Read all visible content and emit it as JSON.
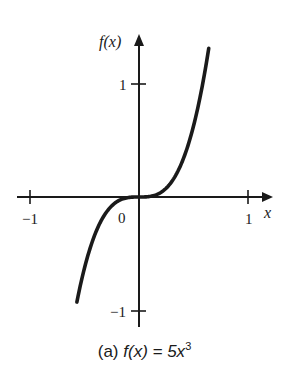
{
  "chart_data": {
    "type": "line",
    "caption_prefix": "(a)",
    "caption_fx": "f(x) = 5x",
    "caption_exp": "3",
    "function": "f(x) = 5x^3",
    "xlabel": "x",
    "ylabel": "f(x)",
    "xlim": [
      -1.1,
      1.2
    ],
    "ylim": [
      -1.2,
      1.5
    ],
    "x_ticks": [
      -1,
      1
    ],
    "x_tick_labels": [
      "−1",
      "1"
    ],
    "y_ticks": [
      -1,
      1
    ],
    "y_tick_labels": [
      "−1",
      "1"
    ],
    "origin_label": "0",
    "grid": false,
    "legend": null,
    "series": [
      {
        "name": "5x^3",
        "x": [
          -0.57,
          -0.5,
          -0.4,
          -0.3,
          -0.2,
          -0.1,
          0,
          0.1,
          0.2,
          0.3,
          0.4,
          0.5,
          0.6,
          0.64
        ],
        "y": [
          -0.93,
          -0.625,
          -0.32,
          -0.135,
          -0.04,
          -0.005,
          0,
          0.005,
          0.04,
          0.135,
          0.32,
          0.625,
          1.08,
          1.31
        ]
      }
    ]
  },
  "axes": {
    "x_axis_label": "x",
    "y_axis_label": "f(x)",
    "tick_neg1_x": "−1",
    "tick_pos1_x": "1",
    "tick_pos1_y": "1",
    "tick_neg1_y": "−1",
    "origin": "0"
  },
  "caption": {
    "prefix": "(a)",
    "fx": "f(x) = 5x",
    "exp": "3"
  },
  "colors": {
    "ink": "#1a1a1a",
    "background": "#ffffff"
  }
}
